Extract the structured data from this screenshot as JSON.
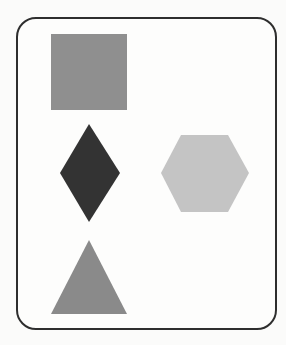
{
  "figure": {
    "width": 286,
    "height": 345,
    "background": "#fbfbfa",
    "frame": {
      "stroke": "#2e2e2e",
      "corner_radius": 20
    },
    "shapes": [
      {
        "id": "square",
        "type": "square",
        "fill": "#8f8f8f",
        "points": "51,34 127,34 127,110 51,110"
      },
      {
        "id": "diamond",
        "type": "diamond",
        "fill": "#333333",
        "points": "89,124 120,173 89,222 60,173"
      },
      {
        "id": "hexagon",
        "type": "hexagon",
        "fill": "#c4c4c4",
        "points": "181,135 228,135 249,173 228,212 181,212 161,173"
      },
      {
        "id": "triangle",
        "type": "triangle",
        "fill": "#8a8a8a",
        "points": "89,240 127,314 51,314"
      }
    ]
  }
}
